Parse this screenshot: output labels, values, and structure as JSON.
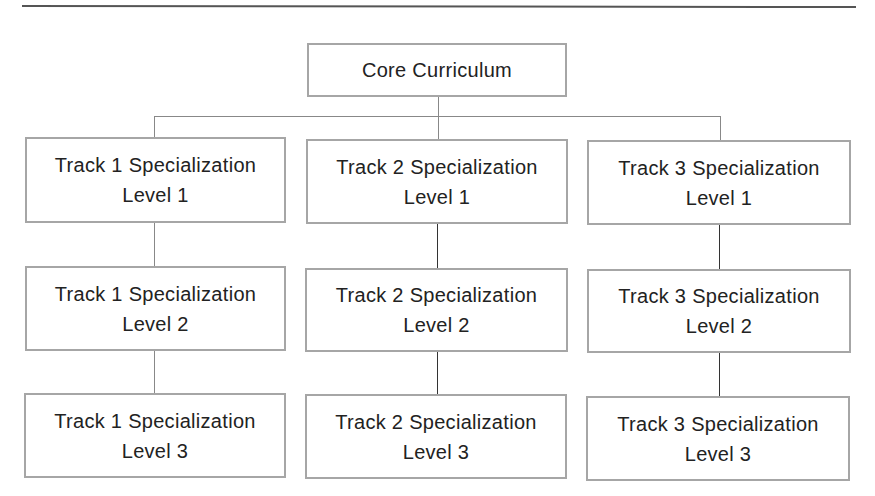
{
  "diagram": {
    "type": "hierarchy",
    "root": {
      "label": "Core Curriculum"
    },
    "tracks": [
      {
        "name": "Track 1",
        "levels": [
          {
            "title": "Track 1 Specialization",
            "level": "Level 1"
          },
          {
            "title": "Track 1 Specialization",
            "level": "Level 2"
          },
          {
            "title": "Track 1 Specialization",
            "level": "Level 3"
          }
        ]
      },
      {
        "name": "Track 2",
        "levels": [
          {
            "title": "Track 2 Specialization",
            "level": "Level 1"
          },
          {
            "title": "Track 2 Specialization",
            "level": "Level 2"
          },
          {
            "title": "Track 2 Specialization",
            "level": "Level 3"
          }
        ]
      },
      {
        "name": "Track 3",
        "levels": [
          {
            "title": "Track 3 Specialization",
            "level": "Level 1"
          },
          {
            "title": "Track 3 Specialization",
            "level": "Level 2"
          },
          {
            "title": "Track 3 Specialization",
            "level": "Level 3"
          }
        ]
      }
    ],
    "colors": {
      "box_border": "#a6a6a6",
      "text": "#222222",
      "rule": "#555555",
      "connector_light": "#888888",
      "connector_dark": "#333333"
    }
  }
}
